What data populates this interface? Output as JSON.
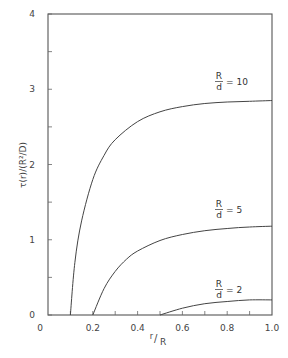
{
  "chart_data": {
    "type": "line",
    "title": "",
    "xlabel": "r/R",
    "ylabel": "τ(r)/(R²/D)",
    "xlim": [
      0,
      1.0
    ],
    "ylim": [
      0,
      4
    ],
    "x_ticks": [
      "0",
      "0.2",
      "0.4",
      "0.6",
      "0.8",
      "1.0"
    ],
    "y_ticks": [
      "0",
      "1",
      "2",
      "3",
      "4"
    ],
    "grid": false,
    "legend": "inline curve labels",
    "series": [
      {
        "name": "R/d = 10",
        "label_num": "R",
        "label_den": "d",
        "label_val": "= 10",
        "x": [
          0.1,
          0.12,
          0.15,
          0.2,
          0.25,
          0.3,
          0.4,
          0.5,
          0.6,
          0.7,
          0.8,
          0.9,
          1.0
        ],
        "y": [
          0.0,
          0.7,
          1.25,
          1.8,
          2.12,
          2.33,
          2.57,
          2.7,
          2.77,
          2.81,
          2.83,
          2.84,
          2.85
        ]
      },
      {
        "name": "R/d = 5",
        "label_num": "R",
        "label_den": "d",
        "label_val": "= 5",
        "x": [
          0.2,
          0.25,
          0.3,
          0.35,
          0.4,
          0.5,
          0.6,
          0.7,
          0.8,
          0.9,
          1.0
        ],
        "y": [
          0.0,
          0.35,
          0.58,
          0.74,
          0.85,
          0.99,
          1.07,
          1.12,
          1.15,
          1.17,
          1.18
        ]
      },
      {
        "name": "R/d = 2",
        "label_num": "R",
        "label_den": "d",
        "label_val": "= 2",
        "x": [
          0.5,
          0.6,
          0.7,
          0.8,
          0.9,
          1.0
        ],
        "y": [
          0.0,
          0.09,
          0.15,
          0.18,
          0.2,
          0.2
        ]
      }
    ]
  },
  "axes": {
    "x_label_main": "r",
    "x_label_den": "R",
    "y_label": "τ(r)/(R²/D)"
  }
}
